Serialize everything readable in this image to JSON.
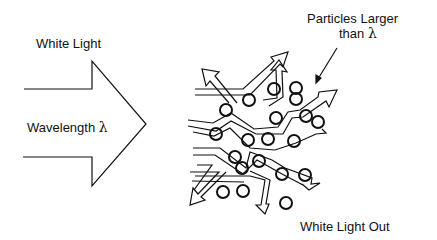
{
  "labels": {
    "white_light": "White Light",
    "wavelength": "Wavelength",
    "lambda": "λ",
    "particles_line1": "Particles Larger",
    "particles_line2_prefix": "than",
    "white_light_out": "White Light Out"
  },
  "colors": {
    "stroke": "#111111",
    "background": "#ffffff"
  }
}
